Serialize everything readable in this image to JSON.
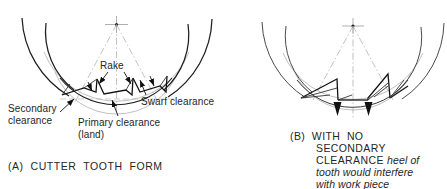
{
  "figure": {
    "background": "#ffffff",
    "ink": "#1a1a1a",
    "thin_ink": "#4a4a4a",
    "construction": "#9a9a9a"
  },
  "diagram_a": {
    "id": "cutter-tooth-form",
    "caption_prefix": "(A)",
    "caption_text": "CUTTER  TOOTH  FORM",
    "caption_full": "(A)  CUTTER  TOOTH  FORM",
    "labels": {
      "rake": "Rake",
      "swarf_clearance": "Swarf clearance",
      "secondary_clearance": "Secondary\nclearance",
      "primary_clearance": "Primary clearance\n(land)"
    }
  },
  "diagram_b": {
    "id": "no-secondary-clearance",
    "caption_prefix": "(B)",
    "caption_upright": "WITH  NO\nSECONDARY\nCLEARANCE ",
    "caption_italic": "heel of\ntooth would interfere\nwith work piece",
    "caption_line1": "(B)  WITH  NO",
    "caption_line2": "SECONDARY",
    "caption_line3": "CLEARANCE ",
    "caption_italic1": "heel of",
    "caption_italic2": "tooth would interfere",
    "caption_italic3": "with work piece"
  }
}
